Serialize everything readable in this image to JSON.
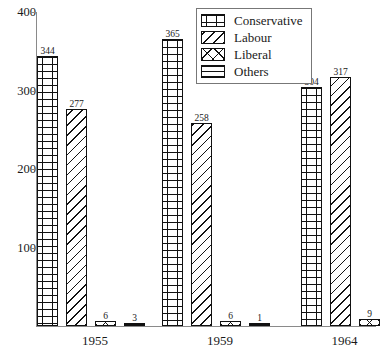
{
  "chart_data": {
    "type": "bar",
    "title": "",
    "xlabel": "",
    "ylabel": "",
    "ylim": [
      0,
      400
    ],
    "ytick_labels": [
      "100",
      "200",
      "300",
      "400"
    ],
    "ytick_values": [
      100,
      200,
      300,
      400
    ],
    "grid": false,
    "legend_position": "top-right",
    "categories": [
      "1955",
      "1959",
      "1964"
    ],
    "series": [
      {
        "name": "Conservative",
        "pattern": "brick",
        "values": [
          344,
          277,
          6
        ]
      },
      {
        "name": "Labour",
        "pattern": "diagonal",
        "values": [
          365,
          258,
          6
        ]
      },
      {
        "name": "Liberal",
        "pattern": "crosshatch",
        "values": [
          304,
          317,
          9
        ]
      },
      {
        "name": "Others",
        "pattern": "horizontal",
        "values": [
          3,
          1,
          null
        ]
      }
    ],
    "groups": [
      {
        "category": "1955",
        "bars": [
          {
            "series": "Conservative",
            "value": 344,
            "label": "344",
            "pattern": "brick"
          },
          {
            "series": "Labour",
            "value": 277,
            "label": "277",
            "pattern": "diagonal"
          },
          {
            "series": "Liberal",
            "value": 6,
            "label": "6",
            "pattern": "crosshatch"
          },
          {
            "series": "Others",
            "value": 3,
            "label": "3",
            "pattern": "horizontal"
          }
        ]
      },
      {
        "category": "1959",
        "bars": [
          {
            "series": "Conservative",
            "value": 365,
            "label": "365",
            "pattern": "brick"
          },
          {
            "series": "Labour",
            "value": 258,
            "label": "258",
            "pattern": "diagonal"
          },
          {
            "series": "Liberal",
            "value": 6,
            "label": "6",
            "pattern": "crosshatch"
          },
          {
            "series": "Others",
            "value": 1,
            "label": "1",
            "pattern": "horizontal"
          }
        ]
      },
      {
        "category": "1964",
        "bars": [
          {
            "series": "Conservative",
            "value": 304,
            "label": "304",
            "pattern": "brick"
          },
          {
            "series": "Labour",
            "value": 317,
            "label": "317",
            "pattern": "diagonal"
          },
          {
            "series": "Liberal",
            "value": 9,
            "label": "9",
            "pattern": "crosshatch"
          }
        ]
      }
    ]
  },
  "legend": {
    "items": [
      {
        "label": "Conservative",
        "pattern": "brick"
      },
      {
        "label": "Labour",
        "pattern": "diagonal"
      },
      {
        "label": "Liberal",
        "pattern": "crosshatch"
      },
      {
        "label": "Others",
        "pattern": "horizontal"
      }
    ]
  },
  "colors": {
    "ink": "#111111",
    "axis": "#8a8a8a",
    "background": "#ffffff"
  }
}
